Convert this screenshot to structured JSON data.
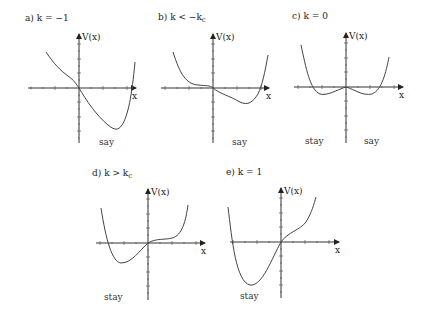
{
  "figure": {
    "panels": [
      {
        "id": "a",
        "title": "a) k = −1",
        "y_label": "V(x)",
        "x_label": "x",
        "annotations": [
          "say"
        ],
        "origin": [
          79,
          88
        ],
        "x_range": [
          28,
          137
        ],
        "y_range": [
          33,
          143
        ],
        "curve": "M 46 52 C 54 64, 60 70, 68 76 C 74 80, 76 84, 79 88 C 86 100, 96 115, 108 125 C 114 130, 118 131, 122 125 C 128 116, 132 95, 135 62"
      },
      {
        "id": "b",
        "title": "b) k < −k",
        "title_sub": "c",
        "y_label": "V(x)",
        "x_label": "x",
        "annotations": [
          "say"
        ],
        "origin": [
          213,
          88
        ],
        "x_range": [
          161,
          270
        ],
        "y_range": [
          33,
          143
        ],
        "curve": "M 173 52 C 180 74, 186 84, 198 85 C 206 86, 210 85, 213 88 C 220 94, 230 96, 240 102 C 248 106, 253 102, 258 94 C 262 86, 265 72, 268 55"
      },
      {
        "id": "c",
        "title": "c) k = 0",
        "y_label": "V(x)",
        "x_label": "x",
        "annotations": [
          "stay",
          "say"
        ],
        "origin": [
          346,
          87
        ],
        "x_range": [
          294,
          404
        ],
        "y_range": [
          33,
          143
        ],
        "curve": "M 301 45 C 306 68, 310 90, 320 94 C 328 96, 336 90, 346 87 C 356 90, 362 96, 372 94 C 382 90, 386 72, 389 57"
      },
      {
        "id": "d",
        "title": "d) k > k",
        "title_sub": "c",
        "y_label": "V(x)",
        "x_label": "x",
        "annotations": [
          "stay"
        ],
        "origin": [
          148,
          243
        ],
        "x_range": [
          96,
          206
        ],
        "y_range": [
          188,
          300
        ],
        "curve": "M 101 208 C 106 240, 112 262, 121 263 C 132 263, 140 250, 148 243 C 156 238, 166 240, 172 238 C 182 236, 186 220, 188 205"
      },
      {
        "id": "e",
        "title": "e) k = 1",
        "y_label": "V(x)",
        "x_label": "x",
        "annotations": [
          "stay"
        ],
        "origin": [
          281,
          242
        ],
        "x_range": [
          230,
          340
        ],
        "y_range": [
          187,
          300
        ],
        "curve": "M 228 207 C 232 240, 236 282, 250 285 C 262 287, 272 258, 281 242 C 288 232, 300 230, 306 222 C 312 212, 314 204, 316 197"
      }
    ]
  }
}
